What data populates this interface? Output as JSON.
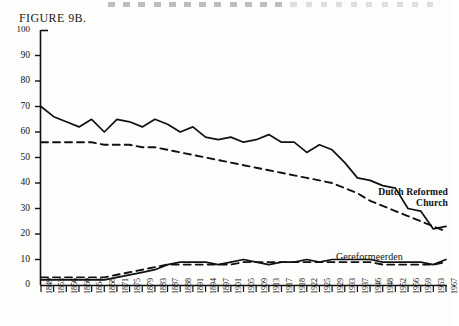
{
  "figure": {
    "title": "FIGURE 9B.",
    "page_artifact": "dashed-bleed-through-strip"
  },
  "annotations": {
    "dutch_reformed_line1": "Dutch Reformed",
    "dutch_reformed_line2": "Church",
    "gereformeerden": "Gereformeerden"
  },
  "chart_data": {
    "type": "line",
    "title": "FIGURE 9B.",
    "xlabel": "",
    "ylabel": "",
    "ylim": [
      0,
      100
    ],
    "yticks": [
      0,
      10,
      20,
      30,
      40,
      50,
      60,
      70,
      80,
      90,
      100
    ],
    "ytick_labels": [
      "0",
      "10",
      "20",
      "30",
      "40",
      "50",
      "60",
      "70",
      "80",
      "90",
      "100"
    ],
    "grid": false,
    "legend": "inline-annotations",
    "categories": [
      "1849",
      "1853",
      "1856",
      "1860",
      "1864",
      "1868",
      "1871",
      "1875",
      "1879",
      "1883",
      "1887",
      "1888",
      "1891",
      "1894",
      "1897",
      "1901",
      "1905",
      "1909",
      "1913",
      "1917",
      "1918",
      "1922",
      "1925",
      "1929",
      "1933",
      "1937",
      "1946",
      "1948",
      "1952",
      "1956",
      "1959",
      "1963",
      "1967"
    ],
    "series": [
      {
        "name": "Dutch Reformed Church",
        "style": "solid",
        "values": [
          70,
          66,
          64,
          62,
          65,
          60,
          65,
          64,
          62,
          65,
          63,
          60,
          62,
          58,
          57,
          58,
          56,
          57,
          59,
          56,
          56,
          52,
          55,
          53,
          48,
          42,
          41,
          39,
          38,
          30,
          29,
          22,
          23
        ]
      },
      {
        "name": "Dutch Reformed Church trend",
        "style": "dashed",
        "values": [
          56,
          56,
          56,
          56,
          56,
          55,
          55,
          55,
          54,
          54,
          53,
          52,
          51,
          50,
          49,
          48,
          47,
          46,
          45,
          44,
          43,
          42,
          41,
          40,
          38,
          36,
          33,
          31,
          29,
          27,
          25,
          23,
          21
        ]
      },
      {
        "name": "Gereformeerden",
        "style": "solid",
        "values": [
          2,
          2,
          2,
          2,
          2,
          2,
          3,
          4,
          5,
          6,
          8,
          9,
          9,
          9,
          8,
          9,
          10,
          9,
          8,
          9,
          9,
          10,
          9,
          10,
          10,
          10,
          10,
          9,
          9,
          9,
          9,
          8,
          10
        ]
      },
      {
        "name": "Gereformeerden trend",
        "style": "dashed",
        "values": [
          3,
          3,
          3,
          3,
          3,
          3,
          4,
          5,
          6,
          7,
          8,
          8,
          8,
          8,
          8,
          8,
          9,
          9,
          9,
          9,
          9,
          9,
          9,
          9,
          9,
          9,
          9,
          8,
          8,
          8,
          8,
          8,
          9
        ]
      }
    ]
  }
}
